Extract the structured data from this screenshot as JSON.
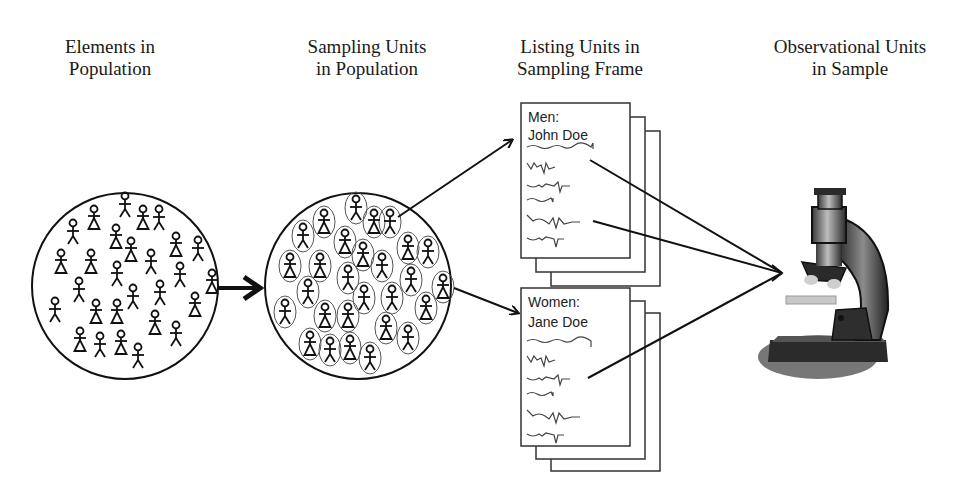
{
  "diagram": {
    "stages": [
      {
        "id": "elements",
        "title_line1": "Elements in",
        "title_line2": "Population"
      },
      {
        "id": "sampling-units",
        "title_line1": "Sampling Units",
        "title_line2": "in Population"
      },
      {
        "id": "listing-units",
        "title_line1": "Listing Units in",
        "title_line2": "Sampling Frame"
      },
      {
        "id": "observational-units",
        "title_line1": "Observational Units",
        "title_line2": "in Sample"
      }
    ],
    "lists": [
      {
        "group": "Men:",
        "name": "John Doe"
      },
      {
        "group": "Women:",
        "name": "Jane Doe"
      }
    ],
    "icons": {
      "population": "stick-figures-in-circle",
      "sampling_units": "stick-figures-in-ovals-in-circle",
      "frame": "stacked-list-pages",
      "sample": "microscope"
    },
    "colors": {
      "line": "#111111",
      "oval": "#555555",
      "background": "#ffffff",
      "microscope_dark": "#333333",
      "microscope_mid": "#8a8a8a",
      "microscope_light": "#d0d0d0"
    }
  }
}
